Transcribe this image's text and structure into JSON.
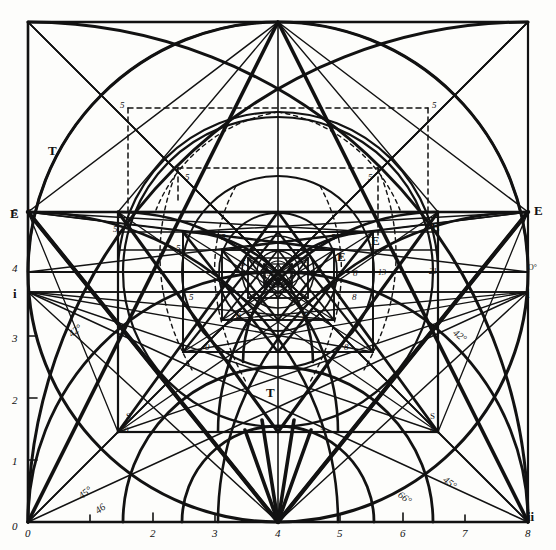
{
  "figure": {
    "type": "geometric-construction-diagram",
    "title": "",
    "caption": "",
    "ink_color": "#121212",
    "paper_color": "#fdfdfb"
  },
  "axes": {
    "x_label": "",
    "y_label": "",
    "x_ticks": [
      "0",
      "2",
      "3",
      "4",
      "5",
      "6",
      "7",
      "8"
    ],
    "y_ticks": [
      "0",
      "1",
      "2",
      "3",
      "4",
      "5"
    ],
    "x_range": [
      0,
      8
    ],
    "y_range": [
      0,
      8
    ],
    "origin_label": "0",
    "corner_label": "0"
  },
  "axis_endpoints": {
    "left_top": "E",
    "left_top_num": "5",
    "left_mid": "4",
    "left_i": "i",
    "left_3": "3",
    "left_2": "2",
    "left_1": "1",
    "left_0": "0",
    "right_top": "E",
    "right_o": "O°",
    "right_i": "i",
    "right_ii": "ii",
    "bottom_right_ii": "ii"
  },
  "angle_labels": [
    {
      "text": "42°",
      "x": 68,
      "y": 325
    },
    {
      "text": "45°",
      "x": 78,
      "y": 487
    },
    {
      "text": "46",
      "x": 95,
      "y": 503
    },
    {
      "text": "42°",
      "x": 453,
      "y": 330
    },
    {
      "text": "45°",
      "x": 443,
      "y": 477
    },
    {
      "text": "66°",
      "x": 398,
      "y": 492
    }
  ],
  "point_labels": [
    {
      "text": "T",
      "x": 48,
      "y": 143,
      "style": "bold"
    },
    {
      "text": "T",
      "x": 266,
      "y": 385,
      "style": "bold"
    },
    {
      "text": "E",
      "x": 10,
      "y": 206,
      "style": "bold"
    },
    {
      "text": "5",
      "x": 28,
      "y": 207,
      "style": "ital"
    },
    {
      "text": "E",
      "x": 534,
      "y": 203,
      "style": "bold"
    },
    {
      "text": "E",
      "x": 371,
      "y": 233,
      "style": "bold"
    },
    {
      "text": "E",
      "x": 431,
      "y": 219,
      "style": "bold"
    },
    {
      "text": "E",
      "x": 337,
      "y": 249,
      "style": "bold"
    },
    {
      "text": "i",
      "x": 13,
      "y": 286,
      "style": "bold"
    },
    {
      "text": "i",
      "x": 526,
      "y": 286,
      "style": "bold"
    },
    {
      "text": "O°",
      "x": 528,
      "y": 263,
      "style": "plain"
    },
    {
      "text": "ii",
      "x": 527,
      "y": 509,
      "style": "bold"
    },
    {
      "text": "S",
      "x": 126,
      "y": 411,
      "style": "plain"
    },
    {
      "text": "S",
      "x": 430,
      "y": 411,
      "style": "plain"
    },
    {
      "text": "0",
      "x": 124,
      "y": 425,
      "style": "ital"
    },
    {
      "text": "8",
      "x": 430,
      "y": 425,
      "style": "ital"
    },
    {
      "text": "5",
      "x": 320,
      "y": 425,
      "style": "ital"
    },
    {
      "text": "5",
      "x": 120,
      "y": 100,
      "style": "ital"
    },
    {
      "text": "5",
      "x": 432,
      "y": 100,
      "style": "ital"
    },
    {
      "text": "5",
      "x": 185,
      "y": 172,
      "style": "ital"
    },
    {
      "text": "5",
      "x": 368,
      "y": 172,
      "style": "ital"
    },
    {
      "text": "5",
      "x": 113,
      "y": 224,
      "style": "ital"
    },
    {
      "text": "5",
      "x": 221,
      "y": 232,
      "style": "ital"
    },
    {
      "text": "5",
      "x": 331,
      "y": 232,
      "style": "ital"
    },
    {
      "text": "5",
      "x": 176,
      "y": 243,
      "style": "ital"
    },
    {
      "text": "5",
      "x": 241,
      "y": 258,
      "style": "ital"
    },
    {
      "text": "5",
      "x": 304,
      "y": 258,
      "style": "ital"
    },
    {
      "text": "5",
      "x": 316,
      "y": 264,
      "style": "ital"
    },
    {
      "text": "3",
      "x": 285,
      "y": 266,
      "style": "ital"
    },
    {
      "text": "5",
      "x": 267,
      "y": 268,
      "style": "ital"
    },
    {
      "text": "8",
      "x": 353,
      "y": 268,
      "style": "ital"
    },
    {
      "text": "13",
      "x": 378,
      "y": 268,
      "style": "ital"
    },
    {
      "text": "21",
      "x": 429,
      "y": 267,
      "style": "ital"
    },
    {
      "text": "0",
      "x": 205,
      "y": 342,
      "style": "ital"
    },
    {
      "text": "8",
      "x": 344,
      "y": 342,
      "style": "ital"
    },
    {
      "text": "0",
      "x": 236,
      "y": 311,
      "style": "ital"
    },
    {
      "text": "5",
      "x": 302,
      "y": 311,
      "style": "ital"
    },
    {
      "text": "8",
      "x": 352,
      "y": 292,
      "style": "ital"
    },
    {
      "text": "5",
      "x": 189,
      "y": 292,
      "style": "ital"
    }
  ],
  "geometry": {
    "outer_square": {
      "x0": 28,
      "y0": 22,
      "x1": 528,
      "y1": 522
    },
    "center": {
      "x": 278,
      "y": 522
    },
    "circles": [
      {
        "cx": 278,
        "cy": 272,
        "r": 250
      },
      {
        "cx": 278,
        "cy": 272,
        "r": 155
      },
      {
        "cx": 278,
        "cy": 272,
        "r": 96
      },
      {
        "cx": 278,
        "cy": 272,
        "r": 59
      },
      {
        "cx": 278,
        "cy": 272,
        "r": 36
      },
      {
        "cx": 278,
        "cy": 272,
        "r": 22
      }
    ],
    "nested_squares": [
      {
        "x0": 28,
        "y0": 22,
        "x1": 528,
        "y1": 522
      },
      {
        "x0": 118,
        "y0": 212,
        "x1": 438,
        "y1": 432
      },
      {
        "x0": 183,
        "y0": 232,
        "x1": 373,
        "y1": 352
      },
      {
        "x0": 222,
        "y0": 250,
        "x1": 334,
        "y1": 320
      },
      {
        "x0": 248,
        "y0": 258,
        "x1": 308,
        "y1": 298
      },
      {
        "x0": 264,
        "y0": 264,
        "x1": 292,
        "y1": 284
      }
    ]
  }
}
